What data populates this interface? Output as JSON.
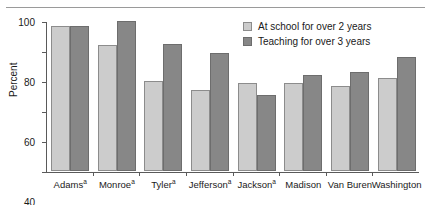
{
  "chart_data": {
    "type": "bar",
    "title": "",
    "xlabel": "",
    "ylabel": "Percent",
    "ylim": [
      0,
      100
    ],
    "yticks": [
      0,
      20,
      40,
      60,
      80,
      100
    ],
    "grid": false,
    "legend_position": "top-right",
    "categories": [
      "Adamsᵃ",
      "Monroeᵃ",
      "Tylerᵃ",
      "Jeffersonᵃ",
      "Jacksonᵃ",
      "Madison",
      "Van Buren",
      "Washington"
    ],
    "category_labels": [
      {
        "name": "Adams",
        "footnote": "a"
      },
      {
        "name": "Monroe",
        "footnote": "a"
      },
      {
        "name": "Tyler",
        "footnote": "a"
      },
      {
        "name": "Jefferson",
        "footnote": "a"
      },
      {
        "name": "Jackson",
        "footnote": "a"
      },
      {
        "name": "Madison",
        "footnote": ""
      },
      {
        "name": "Van Buren",
        "footnote": ""
      },
      {
        "name": "Washington",
        "footnote": ""
      }
    ],
    "series": [
      {
        "name": "At school for over 2 years",
        "color": "#cccccc",
        "values": [
          97,
          84,
          60,
          54,
          59,
          59,
          57,
          62
        ]
      },
      {
        "name": "Teaching for over 3 years",
        "color": "#878787",
        "values": [
          97,
          100,
          85,
          79,
          51,
          64,
          66,
          76
        ]
      }
    ]
  },
  "axis": {
    "y_title": "Percent",
    "y_tick_labels": [
      "100",
      "80",
      "60",
      "40",
      "20",
      "0"
    ]
  },
  "legend": {
    "items": [
      {
        "label": "At school for over 2 years"
      },
      {
        "label": "Teaching for over 3 years"
      }
    ]
  }
}
